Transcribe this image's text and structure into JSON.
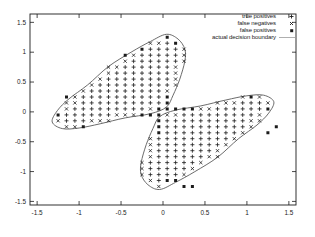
{
  "figure": {
    "width": 315,
    "height": 237,
    "background": "#ffffff",
    "ink_color": "#1c1c1c",
    "boundary_color": "#5a5a5a",
    "legend_line_color": "#9a9a9a"
  },
  "layout": {
    "plot_box": {
      "left": 30,
      "top": 14,
      "right": 296,
      "bottom": 205
    },
    "tick_length": 4
  },
  "legend": {
    "position": "top-right",
    "items": [
      {
        "label": "true positives",
        "marker": "plus"
      },
      {
        "label": "false negatives",
        "marker": "cross"
      },
      {
        "label": "false positives",
        "marker": "square"
      },
      {
        "label": "actual decision boundary",
        "marker": "line"
      }
    ]
  },
  "chart_data": {
    "type": "scatter",
    "title": "",
    "xlabel": "",
    "ylabel": "",
    "x_range": [
      -1.585,
      1.585
    ],
    "y_range": [
      -1.56,
      1.64
    ],
    "x_ticks": [
      -1.5,
      -1,
      -0.5,
      0,
      0.5,
      1,
      1.5
    ],
    "x_tick_labels": [
      "-1.5",
      "-1",
      "-0.5",
      "0",
      "0.5",
      "1",
      "1.5"
    ],
    "y_ticks": [
      -1.5,
      -1,
      -0.5,
      0,
      0.5,
      1,
      1.5
    ],
    "y_tick_labels": [
      "-1.5",
      "-1",
      "-0.5",
      "0",
      "0.5",
      "1",
      "1.5"
    ],
    "grid": {
      "min": -1.45,
      "max": 1.45,
      "step": 0.1
    },
    "fn_band_width": 0.1,
    "actual_region_lobes": [
      [
        [
          -1.32,
          -0.17
        ],
        [
          -1.26,
          0.02
        ],
        [
          -1.12,
          0.22
        ],
        [
          -0.9,
          0.45
        ],
        [
          -0.65,
          0.76
        ],
        [
          -0.38,
          1.0
        ],
        [
          -0.15,
          1.18
        ],
        [
          0.04,
          1.3
        ],
        [
          0.18,
          1.22
        ],
        [
          0.26,
          1.05
        ],
        [
          0.26,
          0.85
        ],
        [
          0.2,
          0.55
        ],
        [
          0.12,
          0.28
        ],
        [
          0.04,
          0.08
        ],
        [
          -0.15,
          -0.03
        ],
        [
          -0.45,
          -0.1
        ],
        [
          -0.75,
          -0.2
        ],
        [
          -1.0,
          -0.27
        ],
        [
          -1.2,
          -0.28
        ]
      ],
      [
        [
          1.32,
          0.17
        ],
        [
          1.26,
          -0.02
        ],
        [
          1.12,
          -0.22
        ],
        [
          0.9,
          -0.45
        ],
        [
          0.65,
          -0.76
        ],
        [
          0.38,
          -1.0
        ],
        [
          0.15,
          -1.18
        ],
        [
          -0.04,
          -1.3
        ],
        [
          -0.18,
          -1.22
        ],
        [
          -0.26,
          -1.05
        ],
        [
          -0.26,
          -0.85
        ],
        [
          -0.2,
          -0.55
        ],
        [
          -0.12,
          -0.28
        ],
        [
          -0.04,
          -0.08
        ],
        [
          0.15,
          0.03
        ],
        [
          0.45,
          0.1
        ],
        [
          0.75,
          0.2
        ],
        [
          1.0,
          0.27
        ],
        [
          1.2,
          0.28
        ]
      ]
    ],
    "false_positive_points": [
      [
        -0.25,
        -0.05
      ],
      [
        -0.15,
        -0.05
      ],
      [
        -0.05,
        -0.05
      ],
      [
        -0.05,
        0.05
      ],
      [
        0.05,
        0.05
      ],
      [
        0.15,
        0.05
      ],
      [
        0.25,
        0.05
      ],
      [
        0.35,
        0.05
      ],
      [
        0.05,
        0.15
      ],
      [
        0.05,
        0.25
      ],
      [
        -0.05,
        -0.15
      ],
      [
        -0.05,
        -0.25
      ],
      [
        -0.05,
        -0.35
      ],
      [
        -1.25,
        -0.05
      ],
      [
        -1.15,
        0.25
      ],
      [
        -0.95,
        -0.25
      ],
      [
        -0.45,
        0.95
      ],
      [
        -0.25,
        1.05
      ],
      [
        0.05,
        1.25
      ],
      [
        0.15,
        1.15
      ],
      [
        0.05,
        -1.15
      ],
      [
        0.15,
        -1.15
      ],
      [
        0.25,
        -1.25
      ],
      [
        0.35,
        -1.25
      ],
      [
        1.05,
        0.25
      ],
      [
        1.25,
        -0.35
      ],
      [
        1.35,
        -0.25
      ],
      [
        1.25,
        0.05
      ]
    ],
    "marker_glyphs": {
      "true_positives": "+",
      "false_negatives": "x",
      "false_positives": "filled-square"
    },
    "legend_entries": [
      "true positives",
      "false negatives",
      "false positives",
      "actual decision boundary"
    ]
  }
}
